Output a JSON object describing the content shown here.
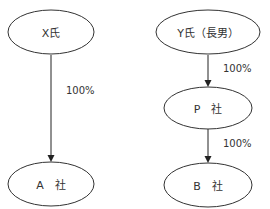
{
  "diagram": {
    "nodes": [
      {
        "id": "x",
        "label": "X氏",
        "cx": 51,
        "cy": 32,
        "rx": 43,
        "ry": 22
      },
      {
        "id": "a",
        "label": "A　社",
        "cx": 51,
        "cy": 184,
        "rx": 43,
        "ry": 22
      },
      {
        "id": "y",
        "label": "Y氏（長男）",
        "cx": 208,
        "cy": 32,
        "rx": 52,
        "ry": 22
      },
      {
        "id": "p",
        "label": "P　社",
        "cx": 208,
        "cy": 108,
        "rx": 44,
        "ry": 21
      },
      {
        "id": "b",
        "label": "B　社",
        "cx": 208,
        "cy": 185,
        "rx": 44,
        "ry": 22
      }
    ],
    "edges": [
      {
        "from": "x",
        "to": "a",
        "label": "100%"
      },
      {
        "from": "y",
        "to": "p",
        "label": "100%"
      },
      {
        "from": "p",
        "to": "b",
        "label": "100%"
      }
    ]
  }
}
